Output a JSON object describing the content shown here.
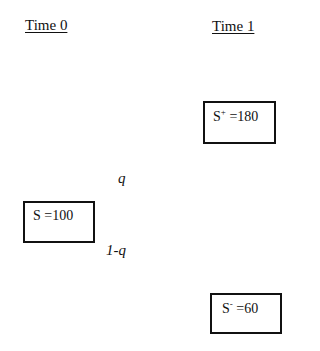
{
  "headings": {
    "time0": "Time 0",
    "time1": "Time 1"
  },
  "nodes": {
    "root": {
      "symbol": "S",
      "superscript": "",
      "value_text": " =100",
      "value": 100
    },
    "up": {
      "symbol": "S",
      "superscript": "+",
      "value_text": " =180",
      "value": 180
    },
    "down": {
      "symbol": "S",
      "superscript": "-",
      "value_text": " =60",
      "value": 60
    }
  },
  "probabilities": {
    "up": "q",
    "down": "1-q"
  }
}
